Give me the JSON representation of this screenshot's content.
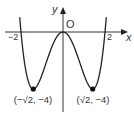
{
  "chart_data": {
    "type": "line",
    "title": "",
    "function": "y = x^4 - 4x^2",
    "xlabel": "x",
    "ylabel": "y",
    "origin_label": "O",
    "x_ticks": [
      "-2",
      "2"
    ],
    "x_range": [
      -2.06,
      2.06
    ],
    "y_range": [
      -4,
      1.05
    ],
    "grid": false,
    "series": [
      {
        "name": "curve",
        "x": [
          -2.06,
          -2,
          -1.8,
          -1.6,
          -1.414,
          -1.2,
          -1.0,
          -0.8,
          -0.6,
          -0.4,
          -0.2,
          0,
          0.2,
          0.4,
          0.6,
          0.8,
          1.0,
          1.2,
          1.414,
          1.6,
          1.8,
          2,
          2.06
        ],
        "y": [
          1.04,
          0,
          -2.46,
          -3.69,
          -4,
          -3.69,
          -3,
          -2.15,
          -1.31,
          -0.61,
          -0.16,
          0,
          -0.16,
          -0.61,
          -1.31,
          -2.15,
          -3,
          -3.69,
          -4,
          -3.69,
          -2.46,
          0,
          1.04
        ]
      }
    ],
    "points": [
      {
        "x": -1.414,
        "y": -4,
        "label": "(−√2, −4)"
      },
      {
        "x": 1.414,
        "y": -4,
        "label": "(√2, −4)"
      }
    ],
    "color": "#222222"
  },
  "labels": {
    "x_axis": "x",
    "y_axis": "y",
    "origin": "O",
    "tick_neg2": "−2",
    "tick_pos2": "2",
    "min_left": "(−√2, −4)",
    "min_right": "(√2, −4)"
  }
}
